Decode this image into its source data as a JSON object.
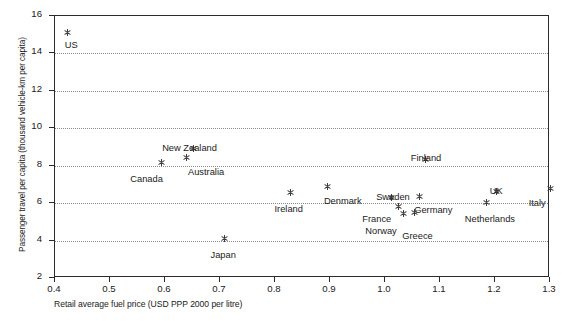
{
  "chart_data": {
    "type": "scatter",
    "title": "",
    "xlabel": "Retail average fuel price (USD PPP 2000 per litre)",
    "ylabel": "Passenger travel per capita (thousand vehicle-km per capita)",
    "xlim": [
      0.4,
      1.3
    ],
    "ylim": [
      2,
      16
    ],
    "xticks": [
      "0.4",
      "0.5",
      "0.6",
      "0.7",
      "0.8",
      "0.9",
      "1.0",
      "1.1",
      "1.2",
      "1.3"
    ],
    "yticks": [
      "2",
      "4",
      "6",
      "8",
      "10",
      "12",
      "14",
      "16"
    ],
    "grid": "horizontal-dotted",
    "legend": "none",
    "marker": "asterisk",
    "points": [
      {
        "label": "US",
        "x": 0.425,
        "y": 15.05,
        "lx": -3,
        "ly": 7
      },
      {
        "label": "New Zealand",
        "x": 0.653,
        "y": 8.85,
        "lx": -31,
        "ly": -6
      },
      {
        "label": "Australia",
        "x": 0.64,
        "y": 8.4,
        "lx": 2,
        "ly": 10
      },
      {
        "label": "Canada",
        "x": 0.595,
        "y": 8.12,
        "lx": -31,
        "ly": 12
      },
      {
        "label": "Japan",
        "x": 0.71,
        "y": 4.05,
        "lx": -14,
        "ly": 11
      },
      {
        "label": "Ireland",
        "x": 0.83,
        "y": 6.5,
        "lx": -16,
        "ly": 11
      },
      {
        "label": "Denmark",
        "x": 0.898,
        "y": 6.85,
        "lx": -4,
        "ly": 10
      },
      {
        "label": "Sweden",
        "x": 1.013,
        "y": 6.27,
        "lx": -15,
        "ly": -5
      },
      {
        "label": "France",
        "x": 1.026,
        "y": 5.75,
        "lx": -36,
        "ly": 7
      },
      {
        "label": "Norway",
        "x": 1.035,
        "y": 5.4,
        "lx": -38,
        "ly": 13
      },
      {
        "label": "Germany",
        "x": 1.064,
        "y": 6.3,
        "lx": -5,
        "ly": 8
      },
      {
        "label": "Greece",
        "x": 1.055,
        "y": 5.45,
        "lx": -12,
        "ly": 19
      },
      {
        "label": "Finland",
        "x": 1.076,
        "y": 8.3,
        "lx": -15,
        "ly": -6
      },
      {
        "label": "Netherlands",
        "x": 1.187,
        "y": 6.0,
        "lx": -22,
        "ly": 12
      },
      {
        "label": "UK",
        "x": 1.205,
        "y": 6.55,
        "lx": -7,
        "ly": -6
      },
      {
        "label": "Italy",
        "x": 1.303,
        "y": 6.75,
        "lx": -22,
        "ly": 10
      }
    ]
  }
}
